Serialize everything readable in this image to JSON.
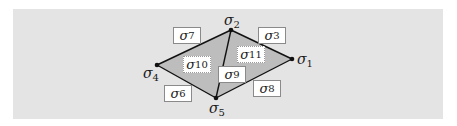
{
  "diagram": {
    "colors": {
      "panel_background": "#e4e4e4",
      "face_fill": "#bdbdbd",
      "edge_stroke": "#111111",
      "vertex_fill": "#111111",
      "label_box_fill": "#ffffff",
      "label_box_border": "#8a8a8a"
    },
    "vertices": [
      {
        "id": "v1",
        "symbol": "σ",
        "index": "1",
        "x": 292,
        "y": 59
      },
      {
        "id": "v2",
        "symbol": "σ",
        "index": "2",
        "x": 231,
        "y": 30
      },
      {
        "id": "v4",
        "symbol": "σ",
        "index": "4",
        "x": 157,
        "y": 65
      },
      {
        "id": "v5",
        "symbol": "σ",
        "index": "5",
        "x": 216,
        "y": 98
      }
    ],
    "edges": [
      {
        "id": "e3",
        "symbol": "σ",
        "index": "3",
        "from": "v2",
        "to": "v1"
      },
      {
        "id": "e6",
        "symbol": "σ",
        "index": "6",
        "from": "v4",
        "to": "v5"
      },
      {
        "id": "e7",
        "symbol": "σ",
        "index": "7",
        "from": "v4",
        "to": "v2"
      },
      {
        "id": "e8",
        "symbol": "σ",
        "index": "8",
        "from": "v5",
        "to": "v1"
      },
      {
        "id": "e9",
        "symbol": "σ",
        "index": "9",
        "from": "v2",
        "to": "v5"
      }
    ],
    "faces": [
      {
        "id": "f10",
        "symbol": "σ",
        "index": "10",
        "vertices": [
          "v4",
          "v2",
          "v5"
        ]
      },
      {
        "id": "f11",
        "symbol": "σ",
        "index": "11",
        "vertices": [
          "v2",
          "v1",
          "v5"
        ]
      }
    ]
  }
}
